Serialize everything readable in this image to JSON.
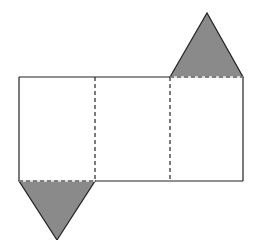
{
  "diagram": {
    "type": "net-of-triangular-prism",
    "colors": {
      "background": "#ffffff",
      "stroke": "#222222",
      "triangle_fill": "#8a8a8a"
    },
    "rectangles": [
      {
        "x": 19,
        "y": 77,
        "w": 76,
        "h": 104
      },
      {
        "x": 95,
        "y": 77,
        "w": 75,
        "h": 104
      },
      {
        "x": 170,
        "y": 77,
        "w": 73,
        "h": 104
      }
    ],
    "triangles": [
      {
        "name": "top-triangle",
        "points": "170,77 207,13 243,77",
        "attached_to": "right rectangle top edge"
      },
      {
        "name": "bottom-triangle",
        "points": "19,181 95,181 57,240",
        "attached_to": "left rectangle bottom edge"
      }
    ],
    "fold_lines": [
      {
        "x1": 95,
        "y1": 77,
        "x2": 95,
        "y2": 181
      },
      {
        "x1": 170,
        "y1": 77,
        "x2": 170,
        "y2": 181
      },
      {
        "x1": 170,
        "y1": 77,
        "x2": 243,
        "y2": 77
      },
      {
        "x1": 19,
        "y1": 181,
        "x2": 95,
        "y2": 181
      }
    ]
  }
}
